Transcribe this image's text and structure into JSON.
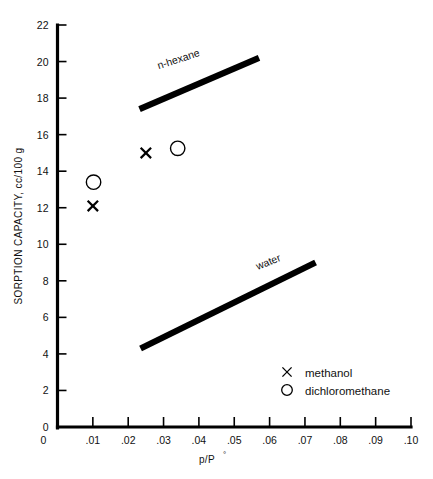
{
  "chart_data": {
    "type": "scatter",
    "title": "",
    "xlabel": "p/P°",
    "ylabel": "SORPTION CAPACITY, cc/100 g",
    "xlim": [
      0,
      0.1
    ],
    "ylim": [
      0,
      22
    ],
    "grid": false,
    "legend_position": "inside-lower-right",
    "x_ticks": [
      0,
      0.01,
      0.02,
      0.03,
      0.04,
      0.05,
      0.06,
      0.07,
      0.08,
      0.09,
      0.1
    ],
    "x_tick_labels": [
      "0",
      ".01",
      ".02",
      ".03",
      ".04",
      ".05",
      ".06",
      ".07",
      ".08",
      ".09",
      ".10"
    ],
    "y_ticks": [
      0,
      2,
      4,
      6,
      8,
      10,
      12,
      14,
      16,
      18,
      20,
      22
    ],
    "y_tick_labels": [
      "0",
      "2",
      "4",
      "6",
      "8",
      "10",
      "12",
      "14",
      "16",
      "18",
      "20",
      "22"
    ],
    "series": [
      {
        "name": "methanol",
        "marker": "x",
        "points": [
          {
            "x": 0.01,
            "y": 12.1
          },
          {
            "x": 0.025,
            "y": 15.0
          }
        ]
      },
      {
        "name": "dichloromethane",
        "marker": "o",
        "points": [
          {
            "x": 0.0102,
            "y": 13.4
          },
          {
            "x": 0.034,
            "y": 15.25
          }
        ]
      }
    ],
    "trend_lines": [
      {
        "name": "n-hexane",
        "label": "n-hexane",
        "x0": 0.0232,
        "y0": 17.4,
        "x1": 0.057,
        "y1": 20.2,
        "label_x": 0.0345,
        "label_y": 19.95,
        "label_rotation": -18
      },
      {
        "name": "water",
        "label": "water",
        "x0": 0.0235,
        "y0": 4.3,
        "x1": 0.073,
        "y1": 9.0,
        "label_x": 0.06,
        "label_y": 8.85,
        "label_rotation": -22
      }
    ],
    "legend_entries": [
      {
        "marker": "x",
        "label": "methanol"
      },
      {
        "marker": "o",
        "label": "dichloromethane"
      }
    ]
  },
  "axes": {
    "y_title": "SORPTION CAPACITY, cc/100 g",
    "x_title_numerator": "p/P",
    "x_title_degree": "°"
  },
  "legend": {
    "methanol_label": "methanol",
    "dichloromethane_label": "dichloromethane"
  },
  "labels": {
    "n_hexane": "n-hexane",
    "water": "water"
  },
  "colors": {
    "ink": "#000000",
    "background": "#ffffff"
  }
}
